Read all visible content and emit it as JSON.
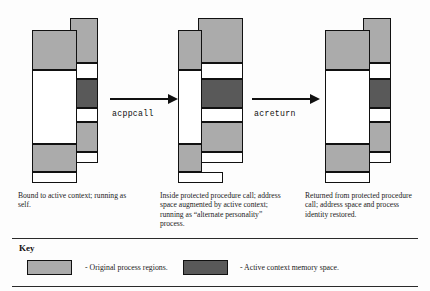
{
  "figure": {
    "background_color": "#fdfdfd",
    "light_region_color": "#ababab",
    "dark_region_color": "#595959",
    "white_region_color": "#ffffff",
    "outline_color": "#111111"
  },
  "arrows": [
    {
      "label": "acppcall"
    },
    {
      "label": "acreturn"
    }
  ],
  "captions": [
    {
      "text": "Bound to active context; running as self."
    },
    {
      "text": "Inside protected procedure call; address space augmented by active context; running as “alternate personality” process."
    },
    {
      "text": "Returned from protected procedure call; address space and process identity restored."
    }
  ],
  "key": {
    "title": "Key",
    "entries": [
      {
        "swatch": "light",
        "label": "- Original process regions."
      },
      {
        "swatch": "dark",
        "label": "- Active context memory space."
      }
    ]
  },
  "diagram_data": {
    "type": "diagram",
    "description": "Three process memory-layout states connected by arrows showing a protected procedure call and return.",
    "states": [
      {
        "name": "bound-to-active-context",
        "wide_bar": {
          "side": "left",
          "segments": [
            "light",
            "white",
            "light",
            "white"
          ]
        },
        "narrow_bar": {
          "side": "right",
          "segments": [
            "light",
            "white",
            "dark",
            "white",
            "light",
            "white"
          ]
        }
      },
      {
        "name": "inside-protected-procedure-call",
        "wide_bar": {
          "side": "right",
          "segments": [
            "light",
            "white",
            "dark",
            "white",
            "light",
            "white"
          ]
        },
        "narrow_bar": {
          "side": "left",
          "segments": [
            "light",
            "white",
            "light",
            "white"
          ]
        }
      },
      {
        "name": "returned-from-protected-procedure-call",
        "wide_bar": {
          "side": "left",
          "segments": [
            "light",
            "white",
            "light",
            "white"
          ]
        },
        "narrow_bar": {
          "side": "right",
          "segments": [
            "light",
            "white",
            "dark",
            "white",
            "light",
            "white"
          ]
        }
      }
    ]
  }
}
